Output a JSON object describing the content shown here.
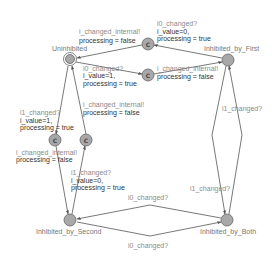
{
  "diagram": {
    "type": "timed-automaton",
    "states": [
      {
        "id": "uninhibited",
        "label": "Uninhibited",
        "initial": true
      },
      {
        "id": "inhibited_by_first",
        "label": "Inhibited_by_First"
      },
      {
        "id": "inhibited_by_second",
        "label": "Inhibited_by_Second"
      },
      {
        "id": "inhibited_by_both",
        "label": "Inhibited_by_Both"
      },
      {
        "id": "c_top",
        "label": "C",
        "committed": true
      },
      {
        "id": "c_mid",
        "label": "C",
        "committed": true
      },
      {
        "id": "c_left",
        "label": "C",
        "committed": true
      },
      {
        "id": "c_right",
        "label": "C",
        "committed": true
      }
    ],
    "edges": {
      "first_to_ctop": {
        "sync": "i0_changed?",
        "update1": "i_value=0,",
        "update2": "processing = true"
      },
      "ctop_to_uninhibited": {
        "sync": "i_changed_internal!",
        "update1": "processing = false"
      },
      "uninhibited_to_cmid": {
        "sync": "i0_changed?",
        "update1": "i_value=1,",
        "update2": "processing = true"
      },
      "cmid_to_first": {
        "sync": "i_changed_internal!",
        "update1": "processing = false"
      },
      "uninhibited_to_cleft": {
        "sync": "i1_changed?",
        "update1": "i_value=1,",
        "update2": "processing = true"
      },
      "cleft_to_second": {
        "sync": "i_changed_internal!",
        "update1": "processing = false"
      },
      "second_to_cright": {
        "sync": "i1_changed?",
        "update1": "i_value=0,",
        "update2": "processing = true"
      },
      "cright_to_uninhibited": {
        "sync": "i_changed_internal!",
        "update1": "processing = false"
      },
      "first_both_up": {
        "sync": "i1_changed?"
      },
      "both_first_down": {
        "sync": "i1_changed?"
      },
      "second_to_both": {
        "sync": "i0_changed?"
      },
      "both_to_second": {
        "sync": "i0_changed?"
      }
    }
  }
}
